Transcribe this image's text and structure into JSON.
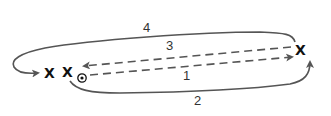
{
  "diagram": {
    "type": "play-diagram",
    "players": [
      {
        "id": "p1",
        "symbol": "X",
        "x": 50,
        "y": 72
      },
      {
        "id": "p2",
        "symbol": "X",
        "x": 68,
        "y": 72
      },
      {
        "id": "p3",
        "symbol": "X",
        "x": 301,
        "y": 50
      }
    ],
    "ball": {
      "symbol": "ball",
      "x": 82,
      "y": 78
    },
    "paths": [
      {
        "label": "1",
        "style": "dashed",
        "description": "pass from ball to right X"
      },
      {
        "label": "2",
        "style": "solid",
        "description": "run from middle X under to right X"
      },
      {
        "label": "3",
        "style": "dashed",
        "description": "pass from right X back to middle X"
      },
      {
        "label": "4",
        "style": "solid",
        "description": "run from right X over top back to left X"
      }
    ],
    "labels": {
      "path1": "1",
      "path2": "2",
      "path3": "3",
      "path4": "4"
    },
    "colors": {
      "line": "#555555",
      "player": "#111111",
      "background": "#ffffff"
    }
  }
}
